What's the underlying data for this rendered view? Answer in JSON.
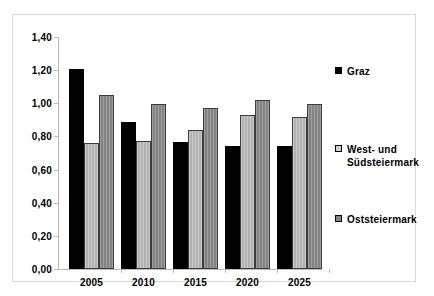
{
  "chart_data": {
    "type": "bar",
    "title": "",
    "subtitle": "",
    "xlabel": "",
    "ylabel": "",
    "categories": [
      "2005",
      "2010",
      "2015",
      "2020",
      "2025"
    ],
    "series": [
      {
        "name": "Graz",
        "color": "#010101",
        "values": [
          1.21,
          0.885,
          0.765,
          0.745,
          0.74
        ]
      },
      {
        "name": "West- und Südsteiermark",
        "name_line1": "West- und",
        "name_line2": "Südsteiermark",
        "color": "#b3b3b3",
        "values": [
          0.76,
          0.77,
          0.84,
          0.93,
          0.92
        ]
      },
      {
        "name": "Oststeiermark",
        "color": "#848484",
        "values": [
          1.05,
          0.995,
          0.97,
          1.02,
          0.995
        ]
      }
    ],
    "ylim": [
      0.0,
      1.4
    ],
    "yticks": [
      0.0,
      0.2,
      0.4,
      0.6,
      0.8,
      1.0,
      1.2,
      1.4
    ],
    "ytick_labels": [
      "0,00",
      "0,20",
      "0,40",
      "0,60",
      "0,80",
      "1,00",
      "1,20",
      "1,40"
    ],
    "grid": false,
    "legend_position": "right"
  },
  "legend": {
    "entries": [
      {
        "label": "Graz",
        "swatch": "swatch-graz"
      },
      {
        "label": "West- und Südsteiermark",
        "swatch": "swatch-west"
      },
      {
        "label": "Oststeiermark",
        "swatch": "swatch-ost"
      }
    ]
  },
  "colors": {
    "graz": "#010101",
    "west_und_suedsteiermark": "#b3b3b3",
    "oststeiermark": "#848484",
    "frame_border": "#d9d9d9",
    "axis": "#b9b9b9",
    "background": "#ffffff"
  }
}
